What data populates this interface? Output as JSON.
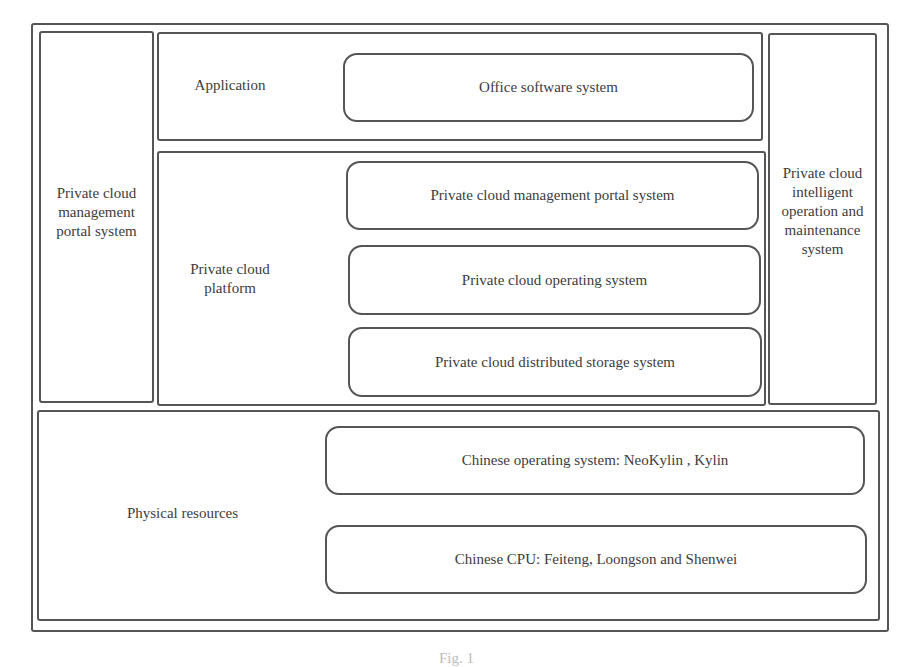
{
  "diagram": {
    "left_panel": {
      "label": "Private cloud\nmanagement\nportal system"
    },
    "right_panel": {
      "label": "Private cloud\nintelligent\noperation and\nmaintenance\nsystem"
    },
    "application_layer": {
      "label": "Application",
      "components": [
        "Office software system"
      ]
    },
    "platform_layer": {
      "label": "Private cloud\nplatform",
      "components": [
        "Private cloud management portal system",
        "Private cloud operating system",
        "Private cloud distributed storage system"
      ]
    },
    "physical_layer": {
      "label": "Physical resources",
      "components": [
        "Chinese operating system:  NeoKylin , Kylin",
        "Chinese CPU:  Feiteng,  Loongson and Shenwei"
      ]
    }
  },
  "caption": "Fig. 1"
}
